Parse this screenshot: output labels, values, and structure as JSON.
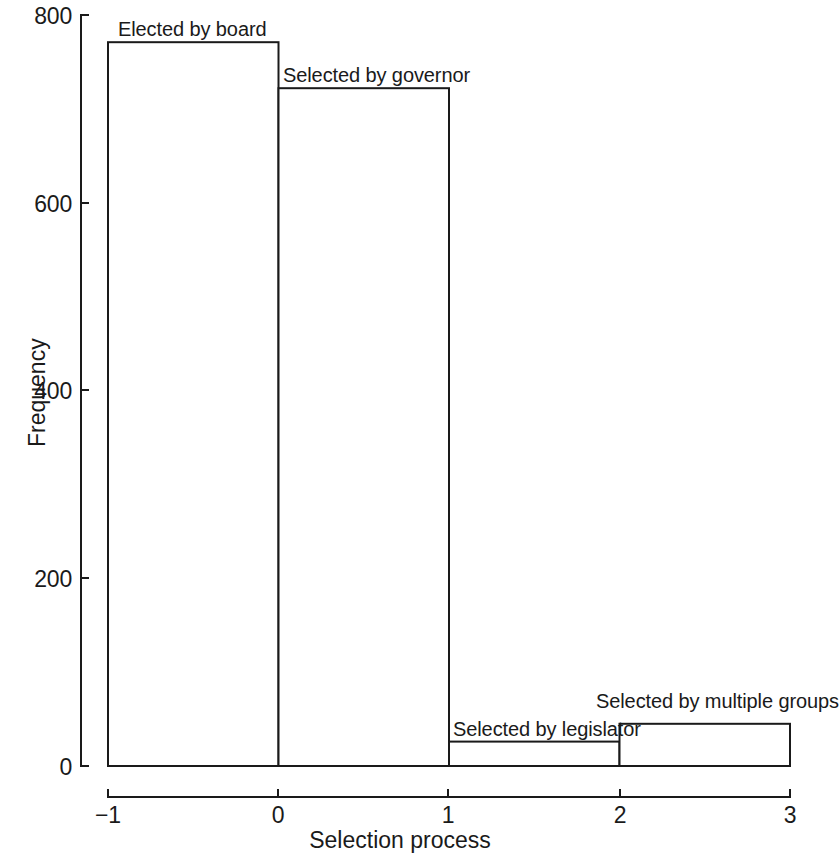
{
  "chart_data": {
    "type": "bar",
    "title": "",
    "subtitle": "",
    "xlabel": "Selection process",
    "ylabel": "Frequency",
    "categories": [
      "-1 to 0",
      "0 to 1",
      "1 to 2",
      "2 to 3"
    ],
    "bin_edges": [
      -1,
      0,
      1,
      2,
      3
    ],
    "values": [
      771,
      722,
      26,
      45
    ],
    "bar_labels": [
      "Elected by board",
      "Selected by governor",
      "Selected by legislator",
      "Selected by multiple groups"
    ],
    "xlim": [
      -1,
      3
    ],
    "ylim": [
      0,
      800
    ],
    "xticks": [
      "−1",
      "0",
      "1",
      "2",
      "3"
    ],
    "xtick_values": [
      -1,
      0,
      1,
      2,
      3
    ],
    "yticks": [
      "0",
      "200",
      "400",
      "600",
      "800"
    ],
    "ytick_values": [
      0,
      200,
      400,
      600,
      800
    ],
    "grid": false,
    "legend": false,
    "legend_position": "none",
    "bar_fill_color": "#ffffff",
    "bar_edge_color": "#1a1a1a",
    "axis_color": "#1a1a1a",
    "background_color": "#ffffff"
  },
  "axes": {
    "x_title": "Selection process",
    "y_title": "Frequency"
  },
  "ticks": {
    "x": [
      {
        "label": "−1",
        "value": -1
      },
      {
        "label": "0",
        "value": 0
      },
      {
        "label": "1",
        "value": 1
      },
      {
        "label": "2",
        "value": 2
      },
      {
        "label": "3",
        "value": 3
      }
    ],
    "y": [
      {
        "label": "0",
        "value": 0
      },
      {
        "label": "200",
        "value": 200
      },
      {
        "label": "400",
        "value": 400
      },
      {
        "label": "600",
        "value": 600
      },
      {
        "label": "800",
        "value": 800
      }
    ]
  },
  "bars": [
    {
      "label": "Elected by board",
      "value": 771,
      "x0": -1,
      "x1": 0
    },
    {
      "label": "Selected by governor",
      "value": 722,
      "x0": 0,
      "x1": 1
    },
    {
      "label": "Selected by legislator",
      "value": 26,
      "x0": 1,
      "x1": 2
    },
    {
      "label": "Selected by multiple groups",
      "value": 45,
      "x0": 2,
      "x1": 3
    }
  ]
}
